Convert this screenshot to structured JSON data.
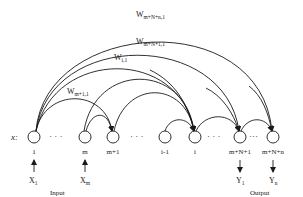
{
  "diagram": {
    "type": "recurrent-network-graph",
    "row_label": "x:",
    "nodes": [
      {
        "id": "1",
        "label": "1",
        "x": 34
      },
      {
        "id": "m",
        "label": "m",
        "x": 85
      },
      {
        "id": "m+1",
        "label": "m+1",
        "x": 113
      },
      {
        "id": "i-1",
        "label": "i-1",
        "x": 165
      },
      {
        "id": "i",
        "label": "i",
        "x": 195
      },
      {
        "id": "m+N+1",
        "label": "m+N+1",
        "x": 240
      },
      {
        "id": "m+N+n",
        "label": "m+N+n",
        "x": 273
      }
    ],
    "ellipses": [
      "· · ·",
      "· · ·",
      "· · ·",
      "···"
    ],
    "edges": [
      {
        "from": "1",
        "to": "m+N+n",
        "label": "W",
        "sub": "m+N+n,1"
      },
      {
        "from": "1",
        "to": "m+N+1",
        "label": "W",
        "sub": "m+N+1,1"
      },
      {
        "from": "1",
        "to": "i",
        "label": "W",
        "sub": "i,1"
      },
      {
        "from": "1",
        "to": "m+1",
        "label": "W",
        "sub": "m+1,1"
      },
      {
        "from": "m",
        "to": "i",
        "label": ""
      },
      {
        "from": "m",
        "to": "m+1",
        "label": ""
      },
      {
        "from": "m+1",
        "to": "i",
        "label": ""
      },
      {
        "from": "i-1",
        "to": "i",
        "label": ""
      },
      {
        "from": "i",
        "to": "m+N+1",
        "label": ""
      },
      {
        "from": "m+N+1",
        "to": "m+N+n",
        "label": ""
      }
    ],
    "inputs": [
      {
        "node": "1",
        "label": "X",
        "sub": "1"
      },
      {
        "node": "m",
        "label": "X",
        "sub": "m"
      }
    ],
    "outputs": [
      {
        "node": "m+N+1",
        "label": "Y",
        "sub": "1"
      },
      {
        "node": "m+N+n",
        "label": "Y",
        "sub": "n"
      }
    ],
    "group_labels": {
      "input": "Input",
      "output": "Output"
    }
  }
}
